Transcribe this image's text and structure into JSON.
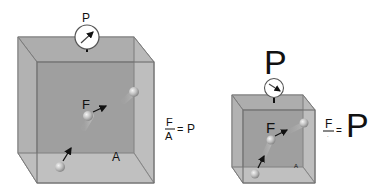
{
  "left_diagram": {
    "gauge_label": "P",
    "force_label": "F",
    "area_label": "A",
    "equation": {
      "numerator": "F",
      "denominator": "A",
      "equals": "=",
      "result": "P"
    }
  },
  "right_diagram": {
    "gauge_label": "P",
    "force_label": "F",
    "area_label": "A",
    "equation": {
      "numerator": "F",
      "denominator": "·",
      "equals": "=",
      "result": "P"
    }
  },
  "colors": {
    "box_back": "#9a9a9a",
    "box_side": "#b4b4b4",
    "box_edge": "#7a7a7a",
    "gauge_face": "#ffffff",
    "text": "#111111",
    "ball": "#c8c8c8"
  }
}
